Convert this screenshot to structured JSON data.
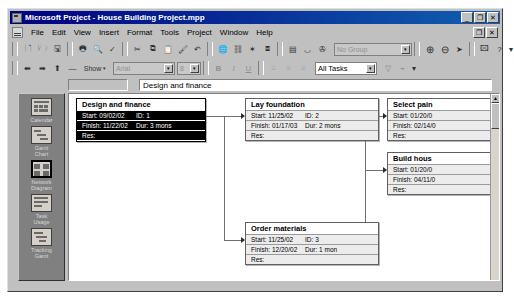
{
  "window": {
    "title": "Microsoft Project - House Building Project.mpp",
    "app_icon": "project-app-icon",
    "minimize_label": "_",
    "restore_label": "❐",
    "close_label": "✕",
    "doc_restore_label": "❐",
    "doc_close_label": "✕"
  },
  "menu": {
    "items": [
      "File",
      "Edit",
      "View",
      "Insert",
      "Format",
      "Tools",
      "Project",
      "Window",
      "Help"
    ]
  },
  "toolbar_standard": {
    "buttons": [
      {
        "name": "new-icon",
        "glyph": "🗋"
      },
      {
        "name": "open-icon",
        "glyph": "🗁"
      },
      {
        "name": "save-icon",
        "glyph": "🖫"
      },
      {
        "name": "print-icon",
        "glyph": "🖶"
      },
      {
        "name": "print-preview-icon",
        "glyph": "🔍"
      },
      {
        "name": "spelling-icon",
        "glyph": "✓"
      },
      {
        "name": "cut-icon",
        "glyph": "✂"
      },
      {
        "name": "copy-icon",
        "glyph": "⧉"
      },
      {
        "name": "paste-icon",
        "glyph": "📋"
      },
      {
        "name": "format-painter-icon",
        "glyph": "🖌"
      },
      {
        "name": "undo-icon",
        "glyph": "↶"
      },
      {
        "name": "hyperlink-icon",
        "glyph": "🌐"
      },
      {
        "name": "link-tasks-icon",
        "glyph": "⛓"
      },
      {
        "name": "unlink-tasks-icon",
        "glyph": "✶"
      },
      {
        "name": "split-task-icon",
        "glyph": "⧈"
      },
      {
        "name": "task-information-icon",
        "glyph": "▤"
      },
      {
        "name": "assign-resources-icon",
        "glyph": "◡"
      },
      {
        "name": "publish-icon",
        "glyph": "✇"
      }
    ],
    "group_combo": {
      "value": "No Group",
      "arrow": "▾"
    },
    "zoom_in_icon": "⊕",
    "zoom_out_icon": "⊖",
    "goto_task_icon": "➤",
    "copy_picture_icon": "🖾",
    "help_icon": "?",
    "overflow_icon": "▾"
  },
  "toolbar_formatting": {
    "outdent_icon": "⬅",
    "indent_icon": "➡",
    "showsub_icon": "⬆",
    "hidesub_icon": "—",
    "show_label": "Show",
    "show_arrow": "▾",
    "font_name": "Arial",
    "font_size": "8",
    "bold_label": "B",
    "italic_label": "I",
    "underline_label": "U",
    "align_left_icon": "≡",
    "align_center_icon": "≡",
    "align_right_icon": "≡",
    "filter_combo": {
      "value": "All Tasks",
      "arrow": "▾"
    },
    "autofilter_icon": "▽",
    "goto_icon": "⌁",
    "overflow_icon": "▾"
  },
  "entry_bar": {
    "value": "Design and finance"
  },
  "sidebar": {
    "items": [
      {
        "label": "Calendar",
        "icon": "calendar-view-icon",
        "selected": false
      },
      {
        "label": "Gantt\nChart",
        "icon": "gantt-chart-view-icon",
        "selected": false
      },
      {
        "label": "Network\nDiagram",
        "icon": "network-diagram-view-icon",
        "selected": true
      },
      {
        "label": "Task\nUsage",
        "icon": "task-usage-view-icon",
        "selected": false
      },
      {
        "label": "Tracking\nGantt",
        "icon": "tracking-gantt-view-icon",
        "selected": false
      }
    ]
  },
  "network_diagram": {
    "labels": {
      "start": "Start:",
      "finish": "Finish:",
      "id": "ID:",
      "dur": "Dur:",
      "res": "Res:"
    },
    "nodes": [
      {
        "key": "design-and-finance",
        "name": "Design and finance",
        "start": "09/02/02",
        "id": "1",
        "finish": "11/22/02",
        "dur": "3 mons",
        "res": "",
        "selected": true
      },
      {
        "key": "lay-foundation",
        "name": "Lay foundation",
        "start": "11/25/02",
        "id": "2",
        "finish": "01/17/03",
        "dur": "2 mons",
        "res": "",
        "selected": false
      },
      {
        "key": "order-materials",
        "name": "Order materials",
        "start": "11/25/02",
        "id": "3",
        "finish": "12/20/02",
        "dur": "1 mon",
        "res": "",
        "selected": false
      },
      {
        "key": "select-paint",
        "name": "Select pain",
        "start": "01/20/0",
        "id": "",
        "finish": "02/14/0",
        "dur": "",
        "res": "",
        "selected": false,
        "clipped": true
      },
      {
        "key": "build-house",
        "name": "Build hous",
        "start": "01/20/0",
        "id": "",
        "finish": "04/11/0",
        "dur": "",
        "res": "",
        "selected": false,
        "clipped": true
      }
    ]
  },
  "scrollbar": {
    "up_arrow": "▲",
    "down_arrow": "▼"
  }
}
